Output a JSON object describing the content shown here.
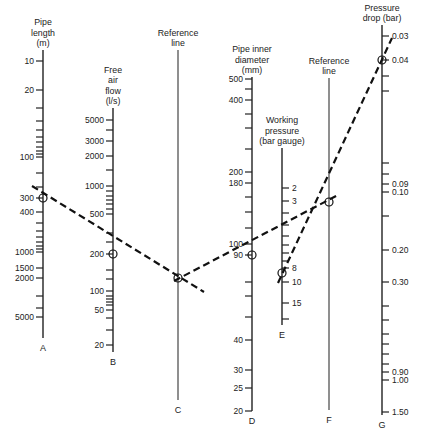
{
  "chart_data": {
    "type": "nomogram",
    "title": "",
    "axes": [
      {
        "id": "A",
        "title": [
          "Pipe",
          "length",
          "(m)"
        ],
        "unit": "m",
        "x": 43,
        "top": 50,
        "bottom": 338,
        "labeled_ticks": [
          {
            "label": "10",
            "y": 61
          },
          {
            "label": "20",
            "y": 90
          },
          {
            "label": "100",
            "y": 157
          },
          {
            "label": "300",
            "y": 198
          },
          {
            "label": "400",
            "y": 212
          },
          {
            "label": "1000",
            "y": 252
          },
          {
            "label": "1500",
            "y": 268
          },
          {
            "label": "2000",
            "y": 278
          },
          {
            "label": "5000",
            "y": 317
          }
        ],
        "minor_ticks": [
          108,
          121,
          130,
          137,
          142,
          147,
          151,
          154,
          173,
          187,
          223,
          231,
          237,
          242,
          246,
          249,
          296,
          308
        ]
      },
      {
        "id": "B",
        "title": [
          "Free",
          "air",
          "flow",
          "(l/s)"
        ],
        "unit": "l/s",
        "x": 113,
        "top": 108,
        "bottom": 352,
        "labeled_ticks": [
          {
            "label": "5000",
            "y": 120
          },
          {
            "label": "3000",
            "y": 141
          },
          {
            "label": "2000",
            "y": 156
          },
          {
            "label": "1000",
            "y": 186
          },
          {
            "label": "500",
            "y": 214
          },
          {
            "label": "200",
            "y": 254
          },
          {
            "label": "100",
            "y": 291
          },
          {
            "label": "50",
            "y": 310
          }
        ],
        "extra_labeled_ticks": [
          {
            "label": "20",
            "y": 345
          }
        ],
        "minor_ticks": [
          130,
          170,
          191,
          196,
          200,
          204,
          209,
          233,
          242,
          270,
          279,
          296,
          299,
          302,
          305,
          318,
          330
        ]
      },
      {
        "id": "C",
        "title": [
          "Reference",
          "line"
        ],
        "unit": "",
        "x": 178,
        "top": 50,
        "bottom": 400,
        "labeled_ticks": []
      },
      {
        "id": "D",
        "title": [
          "Pipe inner",
          "diameter",
          "(mm)"
        ],
        "unit": "mm",
        "x": 252,
        "top": 77,
        "bottom": 411,
        "labeled_ticks": [
          {
            "label": "500",
            "y": 79
          },
          {
            "label": "400",
            "y": 100
          },
          {
            "label": "200",
            "y": 172
          },
          {
            "label": "180",
            "y": 183
          },
          {
            "label": "100",
            "y": 244
          },
          {
            "label": "90",
            "y": 255
          },
          {
            "label": "40",
            "y": 340
          },
          {
            "label": "30",
            "y": 370
          },
          {
            "label": "25",
            "y": 388
          },
          {
            "label": "20",
            "y": 411
          }
        ],
        "minor_ticks": [
          89,
          114,
          128,
          149,
          197,
          212,
          228,
          282,
          296,
          317
        ]
      },
      {
        "id": "E",
        "title": [
          "Working",
          "pressure",
          "(bar gauge)"
        ],
        "unit": "bar gauge",
        "x": 282,
        "top": 148,
        "bottom": 325,
        "labeled_ticks": [
          {
            "label": "2",
            "y": 188
          },
          {
            "label": "3",
            "y": 201
          },
          {
            "label": "8",
            "y": 268
          },
          {
            "label": "10",
            "y": 282
          },
          {
            "label": "15",
            "y": 303
          }
        ],
        "minor_ticks": [
          213,
          225,
          236,
          245,
          253,
          261,
          319
        ]
      },
      {
        "id": "F",
        "title": [
          "Reference",
          "line"
        ],
        "unit": "",
        "x": 329,
        "top": 78,
        "bottom": 410,
        "labeled_ticks": []
      },
      {
        "id": "G",
        "title": [
          "Pressure",
          "drop (bar)"
        ],
        "unit": "bar",
        "x": 382,
        "top": 25,
        "bottom": 415,
        "labeled_ticks": [
          {
            "label": "0.03",
            "y": 36
          },
          {
            "label": "0.04",
            "y": 60
          },
          {
            "label": "0.09",
            "y": 184
          },
          {
            "label": "0.10",
            "y": 192
          },
          {
            "label": "0.20",
            "y": 250
          },
          {
            "label": "0.30",
            "y": 282
          },
          {
            "label": "0.90",
            "y": 372
          },
          {
            "label": "1.00",
            "y": 380
          },
          {
            "label": "1.50",
            "y": 412
          }
        ],
        "minor_ticks": [
          76,
          91,
          163,
          174,
          216,
          306,
          320,
          334,
          344,
          354,
          364
        ]
      }
    ],
    "example_solution": {
      "lines": [
        {
          "from": [
            32,
            186
          ],
          "to": [
            204,
            292
          ],
          "through": [
            "A=300",
            "B=200",
            "C"
          ]
        },
        {
          "from": [
            174,
            281
          ],
          "to": [
            338,
            195
          ],
          "through": [
            "C",
            "D=90",
            "F"
          ]
        },
        {
          "from": [
            278,
            283
          ],
          "to": [
            392,
            38
          ],
          "through": [
            "E=8..10",
            "F",
            "G=0.04"
          ]
        }
      ],
      "markers": [
        {
          "axis": "A",
          "value": "300",
          "x": 43,
          "y": 198
        },
        {
          "axis": "B",
          "value": "200",
          "x": 113,
          "y": 254
        },
        {
          "axis": "C",
          "value": "",
          "x": 178,
          "y": 278
        },
        {
          "axis": "D",
          "value": "90",
          "x": 252,
          "y": 255
        },
        {
          "axis": "E",
          "value": "9",
          "x": 282,
          "y": 273
        },
        {
          "axis": "F",
          "value": "",
          "x": 329,
          "y": 202
        },
        {
          "axis": "G",
          "value": "0.04",
          "x": 382,
          "y": 60
        }
      ]
    },
    "xlabel": "",
    "ylabel": "",
    "grid": false,
    "legend": null
  }
}
